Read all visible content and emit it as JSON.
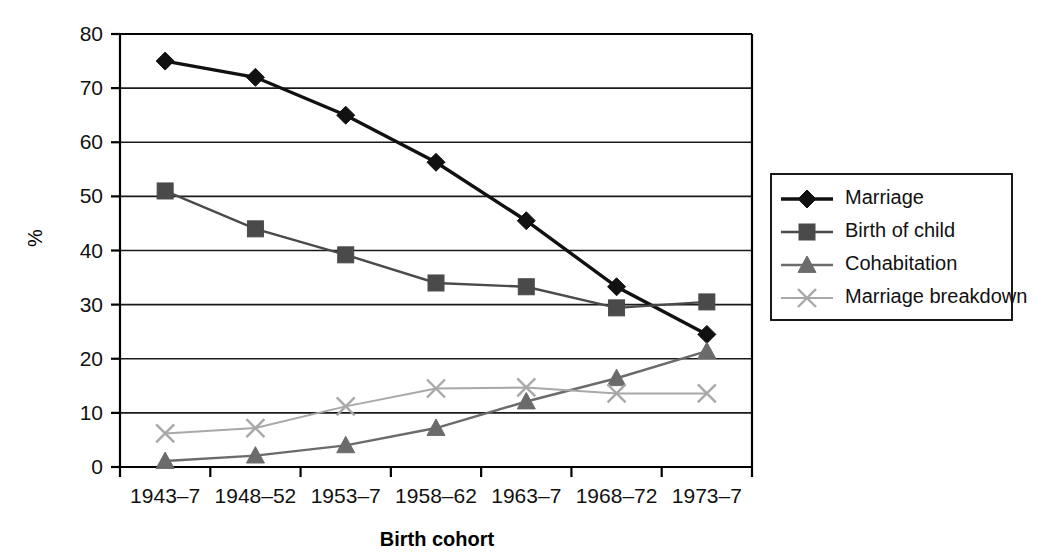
{
  "chart_data": {
    "type": "line",
    "title": "",
    "xlabel": "Birth cohort",
    "ylabel": "%",
    "categories": [
      "1943–7",
      "1948–52",
      "1953–7",
      "1958–62",
      "1963–7",
      "1968–72",
      "1973–7"
    ],
    "ylim": [
      0,
      80
    ],
    "yticks": [
      0,
      10,
      20,
      30,
      40,
      50,
      60,
      70,
      80
    ],
    "ytick_labels": [
      "0",
      "10",
      "20",
      "30",
      "40",
      "50",
      "60",
      "70",
      "80"
    ],
    "grid": true,
    "legend_position": "right",
    "series": [
      {
        "name": "Marriage",
        "values": [
          75.0,
          72.0,
          65.0,
          56.3,
          45.5,
          33.3,
          24.5
        ],
        "color": "#111111",
        "marker": "diamond"
      },
      {
        "name": "Birth of child",
        "values": [
          51.0,
          44.0,
          39.2,
          34.0,
          33.3,
          29.4,
          30.5
        ],
        "color": "#4a4a4a",
        "marker": "square"
      },
      {
        "name": "Cohabitation",
        "values": [
          1.1,
          2.1,
          4.0,
          7.2,
          12.1,
          16.4,
          21.4
        ],
        "color": "#6b6b6b",
        "marker": "triangle"
      },
      {
        "name": "Marriage breakdown",
        "values": [
          6.2,
          7.2,
          11.2,
          14.5,
          14.7,
          13.6,
          13.6
        ],
        "color": "#a8a8a8",
        "marker": "cross"
      }
    ]
  },
  "legend": {
    "items": [
      {
        "label": "Marriage"
      },
      {
        "label": "Birth of child"
      },
      {
        "label": "Cohabitation"
      },
      {
        "label": "Marriage breakdown"
      }
    ]
  }
}
